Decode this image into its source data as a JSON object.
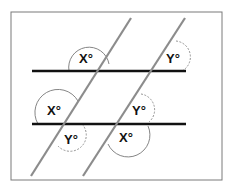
{
  "diagram": {
    "type": "parallel-lines-transversals",
    "labels": {
      "top_left_angle": "X°",
      "top_right_angle": "Y°",
      "bottom_left_upper_angle": "X°",
      "bottom_left_lower_angle": "Y°",
      "bottom_right_upper_angle": "Y°",
      "bottom_right_lower_angle": "X°"
    },
    "colors": {
      "parallel_lines": "#111111",
      "transversals": "#8c8c8c",
      "frame": "#7a7a7a",
      "arc_solid": "#777777",
      "arc_dashed": "#888888"
    }
  }
}
